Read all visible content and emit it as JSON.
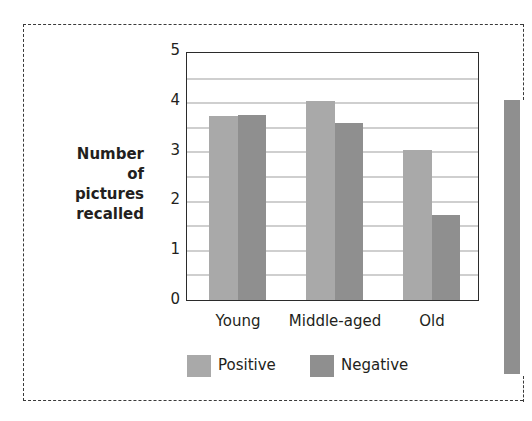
{
  "chart_data": {
    "type": "bar",
    "title": "",
    "xlabel": "",
    "ylabel": "Number of pictures recalled",
    "ylabel_lines": [
      "Number",
      "of pictures",
      "recalled"
    ],
    "categories": [
      "Young",
      "Middle-aged",
      "Old"
    ],
    "series": [
      {
        "name": "Positive",
        "color": "#a9a9a9",
        "values": [
          3.73,
          4.04,
          3.05
        ]
      },
      {
        "name": "Negative",
        "color": "#8f8f8f",
        "values": [
          3.77,
          3.59,
          1.73
        ]
      }
    ],
    "ylim": [
      0,
      5
    ],
    "yticks": [
      "0",
      "1",
      "2",
      "3",
      "4",
      "5"
    ],
    "gridlines": [
      0.5,
      1,
      1.5,
      2,
      2.5,
      3,
      3.5,
      4,
      4.5
    ],
    "grid": true,
    "legend_position": "bottom"
  },
  "legend": {
    "positive": "Positive",
    "negative": "Negative"
  }
}
